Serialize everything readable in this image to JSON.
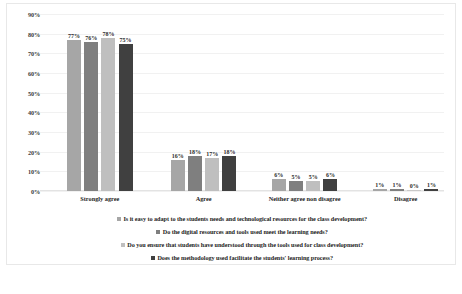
{
  "chart_data": {
    "type": "bar",
    "title": "",
    "xlabel": "",
    "ylabel": "",
    "ylim": [
      0,
      90
    ],
    "ytick_step": 10,
    "grid": true,
    "legend_position": "bottom",
    "categories": [
      "Strongly agree",
      "Agree",
      "Neither agree non disagree",
      "Disagree"
    ],
    "ytick_labels": [
      "0%",
      "10%",
      "20%",
      "30%",
      "40%",
      "50%",
      "60%",
      "70%",
      "80%",
      "90%"
    ],
    "series": [
      {
        "name": "Is it easy to adapt to the students needs and technological resources for the class development?",
        "color": "#A6A6A6",
        "values": [
          77,
          16,
          6,
          1
        ],
        "labels": [
          "77%",
          "16%",
          "6%",
          "1%"
        ]
      },
      {
        "name": "Do the digital resources and tools used meet the learning needs?",
        "color": "#7F7F7F",
        "values": [
          76,
          18,
          5,
          1
        ],
        "labels": [
          "76%",
          "18%",
          "5%",
          "1%"
        ]
      },
      {
        "name": "Do you ensure that students have understood through the tools used for class development?",
        "color": "#BFBFBF",
        "values": [
          78,
          17,
          5,
          0
        ],
        "labels": [
          "78%",
          "17%",
          "5%",
          "0%"
        ]
      },
      {
        "name": "Does the methodology used facilitate the students' learning process?",
        "color": "#404040",
        "values": [
          75,
          18,
          6,
          1
        ],
        "labels": [
          "75%",
          "18%",
          "6%",
          "1%"
        ]
      }
    ]
  },
  "caption": {
    "text": ""
  }
}
